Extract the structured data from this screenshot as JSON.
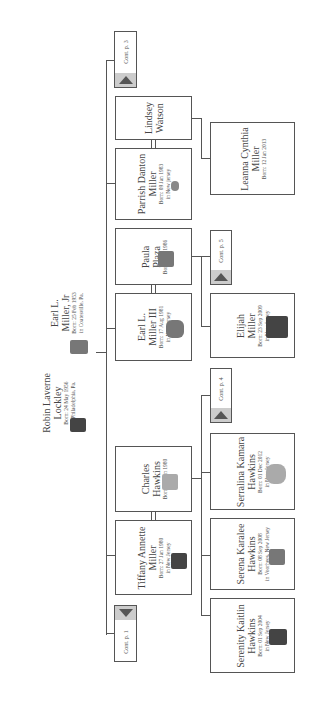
{
  "parents": [
    {
      "name_line1": "Earl L.",
      "name_line2": "Miller, Jr",
      "birth": "Born: 25 Feb 1953",
      "place": "in Coatesville, Pa."
    },
    {
      "name_line1": "Robin Laverne",
      "name_line2": "Lockley",
      "birth": "Born: 24 May 1956",
      "place": "in Philadelphia, Pa."
    }
  ],
  "children": [
    {
      "id": "parrish",
      "name_line1": "Parrish Danton",
      "name_line2": "Miller",
      "birth": "Born: 09 Jan 1983",
      "place": "in New jersey"
    },
    {
      "id": "lindsey",
      "name_line1": "Lindsey",
      "name_line2": "Watson",
      "birth": "",
      "place": ""
    },
    {
      "id": "earl3",
      "name_line1": "Earl L.",
      "name_line2": "Miller III",
      "birth": "Born: 17 Aug 1981",
      "place": "in New jersey"
    },
    {
      "id": "paula",
      "name_line1": "Paula",
      "name_line2": "Plaza",
      "birth": "Born: Apr 1986",
      "place": ""
    },
    {
      "id": "tiffany",
      "name_line1": "Tiffany Annette",
      "name_line2": "Miller",
      "birth": "Born: 27 Jan 1980",
      "place": "in New Jersey"
    },
    {
      "id": "charles",
      "name_line1": "Charles",
      "name_line2": "Hawkins",
      "birth": "Born: 11 Jun 1980",
      "place": ""
    }
  ],
  "grandchildren": [
    {
      "id": "leanna",
      "name_line1": "Leanna Cynthia",
      "name_line2": "Miller",
      "birth": "Born: 12 Jan 2013",
      "place": ""
    },
    {
      "id": "elijah",
      "name_line1": "Elijah",
      "name_line2": "Miller",
      "birth": "Born: 23 Sep 2009",
      "place": "in New Jersey"
    },
    {
      "id": "serralina",
      "name_line1": "Serralina Kamara",
      "name_line2": "Hawkins",
      "birth": "Born: 01 Dec 2012",
      "place": "in New Jersey"
    },
    {
      "id": "serena",
      "name_line1": "Serena Karalee",
      "name_line2": "Hawkins",
      "birth": "Born: 08 Sep 2008",
      "place": "in Voorhees, New Jersey"
    },
    {
      "id": "serenity",
      "name_line1": "Serenity Kaitlin",
      "name_line2": "Hawkins",
      "birth": "Born: 01 Sep 2004",
      "place": "in New Jersey"
    }
  ],
  "continuations": {
    "top": "Cont. p. 3",
    "paula_earl": "Cont. p. 5",
    "tiffany_charles": "Cont. p. 4",
    "bottom": "Cont. p. 1"
  }
}
